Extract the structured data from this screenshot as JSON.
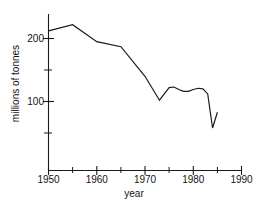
{
  "chart_data": {
    "type": "line",
    "title": "",
    "xlabel": "year",
    "ylabel": "millions of tonnes",
    "xlim": [
      1950,
      1990
    ],
    "ylim": [
      0,
      240
    ],
    "grid": false,
    "legend": null,
    "x_ticks_major": [
      1950,
      1960,
      1970,
      1980,
      1990
    ],
    "x_ticks_major_labels": [
      "1950",
      "1960",
      "1970",
      "1980",
      "1990"
    ],
    "x_ticks_minor": [
      1955,
      1965,
      1975,
      1985
    ],
    "y_ticks_major": [
      100,
      200
    ],
    "y_ticks_major_labels": [
      "100",
      "200"
    ],
    "y_ticks_minor": [
      50,
      150
    ],
    "series": [
      {
        "name": "production",
        "color": "#1a1a1a",
        "x": [
          1950,
          1955,
          1960,
          1965,
          1970,
          1973,
          1974,
          1975,
          1976,
          1977,
          1978,
          1979,
          1980,
          1981,
          1982,
          1983,
          1984,
          1985
        ],
        "values": [
          212,
          222,
          195,
          187,
          140,
          102,
          112,
          122,
          123,
          119,
          116,
          116,
          119,
          121,
          120,
          112,
          58,
          83
        ]
      }
    ]
  },
  "axis": {
    "y_label_200": "200",
    "y_label_100": "100",
    "x_label_1950": "1950",
    "x_label_1960": "1960",
    "x_label_1970": "1970",
    "x_label_1980": "1980",
    "x_label_1990": "1990",
    "x_title": "year",
    "y_title": "millions of tonnes"
  }
}
